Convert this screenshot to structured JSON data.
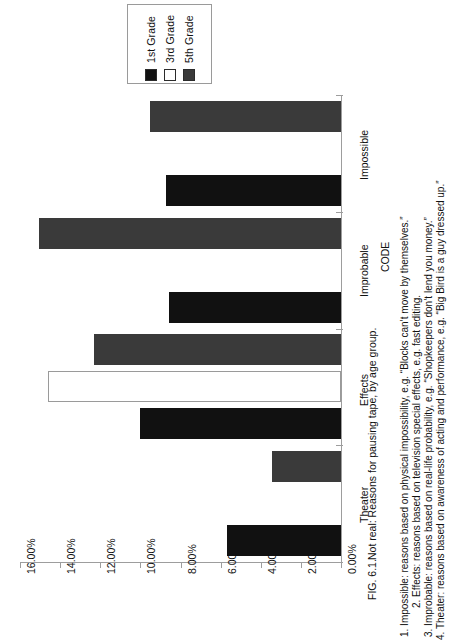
{
  "figure": {
    "caption_label": "FIG. 6.1.",
    "caption_text": "Not real: Reasons for pausing tape, by age group.",
    "code_heading": "CODE",
    "code_items": [
      "1. Impossible: reasons based on physical impossibility, e.g. “Blocks can’t move by themselves.”",
      "2. Effects: reasons based on television special effects, e.g. fast editing.",
      "3. Improbable: reasons based on real-life probability, e.g. “Shopkeepers don’t lend you money.”",
      "4. Theater: reasons based on awareness of acting and performance, e.g. “Big Bird is a guy dressed up.”"
    ]
  },
  "legend": {
    "entries": [
      {
        "label": "1st Grade",
        "color": "#111111"
      },
      {
        "label": "3rd Grade",
        "color": "#ffffff"
      },
      {
        "label": "5th Grade",
        "color": "#3a3a3a"
      }
    ]
  },
  "chart_data": {
    "type": "bar",
    "orientation": "horizontal",
    "title": "Not real: Reasons for pausing tape, by age group.",
    "xlabel": "",
    "ylabel": "",
    "categories": [
      "Impossible",
      "Improbable",
      "Effects",
      "Theater"
    ],
    "series": [
      {
        "name": "1st Grade",
        "color": "#111111",
        "values": [
          8.7,
          8.55,
          10.0,
          5.7
        ]
      },
      {
        "name": "3rd Grade",
        "color": "#ffffff",
        "values": [
          0.0,
          0.0,
          14.6,
          0.0
        ]
      },
      {
        "name": "5th Grade",
        "color": "#3a3a3a",
        "values": [
          9.5,
          15.05,
          12.3,
          3.45
        ]
      }
    ],
    "value_axis": {
      "ticks": [
        "16.00%",
        "14.00%",
        "12.00%",
        "10.00%",
        "8.00%",
        "6.00%",
        "4.00%",
        "2.00%",
        "0.00%"
      ],
      "tick_values": [
        16,
        14,
        12,
        10,
        8,
        6,
        4,
        2,
        0
      ],
      "min": 0,
      "max": 16,
      "reversed": true
    },
    "grid": false,
    "legend_position": "top-left"
  }
}
